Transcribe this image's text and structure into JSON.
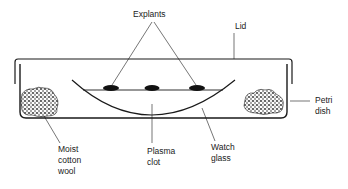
{
  "labels": {
    "explants": "Explants",
    "lid": "Lid",
    "petri_dish": "Petri\ndish",
    "moist_cotton_wool": "Moist\ncotton\nwool",
    "plasma_clot": "Plasma\nclot",
    "watch_glass": "Watch\nglass"
  },
  "colors": {
    "stroke": "#1a1a1a",
    "fill_dark": "#111111",
    "background": "#ffffff"
  }
}
